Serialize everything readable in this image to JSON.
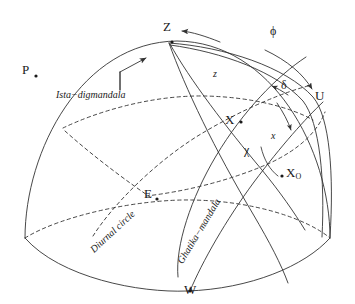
{
  "figure": {
    "type": "celestial-sphere-diagram",
    "caption_fragment": "",
    "background": "#ffffff",
    "stroke": "#333333",
    "text_color": "#1a1a1a"
  },
  "points": [
    {
      "id": "Z",
      "label": "Z",
      "x": 167,
      "y": 28,
      "desc": "zenith"
    },
    {
      "id": "P",
      "label": "P",
      "x": 26,
      "y": 70,
      "desc": "celestial-pole"
    },
    {
      "id": "U",
      "label": "U",
      "x": 318,
      "y": 96,
      "desc": "upper-point"
    },
    {
      "id": "X",
      "label": "X",
      "x": 229,
      "y": 120,
      "desc": "body-position"
    },
    {
      "id": "X0",
      "label": "X",
      "sub": "O",
      "x": 288,
      "y": 173,
      "desc": "body-on-ghatika"
    },
    {
      "id": "E",
      "label": "E",
      "x": 147,
      "y": 194,
      "desc": "east-point"
    },
    {
      "id": "W",
      "label": "W",
      "x": 187,
      "y": 290,
      "desc": "west-point"
    }
  ],
  "angles": [
    {
      "id": "phi",
      "label": "ϕ",
      "x": 273,
      "y": 31,
      "desc": "latitude-phi"
    },
    {
      "id": "z",
      "label": "z",
      "x": 216,
      "y": 75,
      "desc": "zenith-distance"
    },
    {
      "id": "delta",
      "label": "δ",
      "x": 283,
      "y": 85,
      "desc": "declination"
    },
    {
      "id": "x",
      "label": "x",
      "x": 273,
      "y": 136,
      "desc": "arc-x"
    },
    {
      "id": "chi",
      "label": "χ",
      "x": 247,
      "y": 150,
      "desc": "arc-chi"
    }
  ],
  "curve_labels": [
    {
      "id": "ista",
      "text": "Ista−digmandala",
      "x": 56,
      "y": 84,
      "rotate": 0,
      "desc": "ista-digmandala-great-circle"
    },
    {
      "id": "diurnal",
      "text": "Diurnal circle",
      "x": 106,
      "y": 248,
      "rotate": -43,
      "desc": "diurnal-circle"
    },
    {
      "id": "ghatika",
      "text": "Ghatika−mandala",
      "x": 186,
      "y": 256,
      "rotate": -59,
      "desc": "ghatika-mandala-celestial-equator"
    }
  ],
  "arrows": [
    {
      "id": "z-arc-arrow",
      "desc": "arrow along zenith arc toward Z"
    },
    {
      "id": "phi-arc-arrow",
      "desc": "arrow along phi band toward U"
    },
    {
      "id": "delta-arrow",
      "desc": "arrow pointing up-left labelling delta"
    },
    {
      "id": "x-arrow",
      "desc": "arrow pointing down-right labelling x"
    },
    {
      "id": "ista-leader",
      "desc": "leader arrow from Ista-digmandala text to great circle"
    }
  ]
}
